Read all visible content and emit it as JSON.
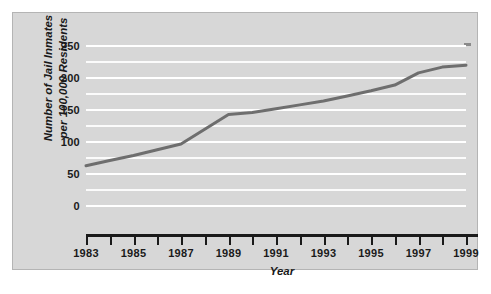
{
  "chart_data": {
    "type": "line",
    "title": "",
    "xlabel": "Year",
    "ylabel": "Number of Jail Inmates\nper 100,000 Residents",
    "ylabel_line1": "Number of Jail Inmates",
    "ylabel_line2": "per 100,000 Residents",
    "x": [
      1983,
      1984,
      1985,
      1986,
      1987,
      1988,
      1989,
      1990,
      1991,
      1992,
      1993,
      1994,
      1995,
      1996,
      1997,
      1998,
      1999
    ],
    "values": [
      63,
      71,
      79,
      88,
      97,
      120,
      143,
      146,
      152,
      158,
      164,
      172,
      180,
      189,
      208,
      217,
      220
    ],
    "series": [
      {
        "name": "Jail inmates per 100,000 residents",
        "values": [
          63,
          71,
          79,
          88,
          97,
          120,
          143,
          146,
          152,
          158,
          164,
          172,
          180,
          189,
          208,
          217,
          220
        ],
        "color": "#6e6e6e"
      }
    ],
    "xlim": [
      1983,
      1999
    ],
    "ylim": [
      0,
      250
    ],
    "ytick_labels": [
      "250",
      "200",
      "150",
      "100",
      "50",
      "0"
    ],
    "ytick_values": [
      250,
      200,
      150,
      100,
      50,
      0
    ],
    "xtick_values": [
      1983,
      1984,
      1985,
      1986,
      1987,
      1988,
      1989,
      1990,
      1991,
      1992,
      1993,
      1994,
      1995,
      1996,
      1997,
      1998,
      1999
    ],
    "xtick_labels": [
      "1983",
      "",
      "1985",
      "",
      "1987",
      "",
      "1989",
      "",
      "1991",
      "",
      "1993",
      "",
      "1995",
      "",
      "1997",
      "",
      "1999"
    ],
    "xtick_labels_shown": [
      "1983",
      "1985",
      "1987",
      "1989",
      "1991",
      "1993",
      "1995",
      "1997",
      "1999"
    ],
    "grid": true,
    "grid_minor_step": 25,
    "grid_major_step": 50,
    "legend": "none",
    "legend_position": "none",
    "colors": {
      "panel_background": "#d7d7d7",
      "gridline": "#ffffff",
      "line": "#6e6e6e",
      "axis": "#1a1a1a",
      "text": "#1a1a1a",
      "page_background": "#ffffff"
    }
  }
}
